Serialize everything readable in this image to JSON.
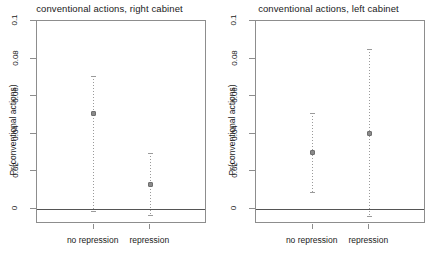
{
  "chart_data": [
    {
      "type": "scatter",
      "title": "conventional actions, right cabinet",
      "xlabel": "",
      "ylabel": "Pr(conventional actions)",
      "categories": [
        "no repression",
        "repression"
      ],
      "values": [
        0.051,
        0.013
      ],
      "ci_lower": [
        -0.001,
        -0.003
      ],
      "ci_upper": [
        0.071,
        0.03
      ],
      "ylim": [
        -0.008,
        0.1
      ],
      "yticks": [
        0,
        0.02,
        0.04,
        0.06,
        0.08,
        0.1
      ],
      "ytick_labels": [
        "0",
        "0.02",
        "0.04",
        "0.06",
        "0.08",
        "0.1"
      ],
      "grid": false,
      "legend": "none",
      "reference_line": 0
    },
    {
      "type": "scatter",
      "title": "conventional actions, left cabinet",
      "xlabel": "",
      "ylabel": "Pr(conventional actions)",
      "categories": [
        "no repression",
        "repression"
      ],
      "values": [
        0.03,
        0.04
      ],
      "ci_lower": [
        0.009,
        -0.004
      ],
      "ci_upper": [
        0.051,
        0.085
      ],
      "ylim": [
        -0.008,
        0.1
      ],
      "yticks": [
        0,
        0.02,
        0.04,
        0.06,
        0.08,
        0.1
      ],
      "ytick_labels": [
        "0",
        "0.02",
        "0.04",
        "0.06",
        "0.08",
        "0.1"
      ],
      "grid": false,
      "legend": "none",
      "reference_line": 0
    }
  ],
  "colors": {
    "point": "#8a8a8a",
    "point_border": "#6f6f6f",
    "errorbar": "#9a9a9a",
    "axis": "#8d8d8d",
    "reference_line": "#555555",
    "text": "#1a1a1a",
    "background": "#ffffff"
  }
}
